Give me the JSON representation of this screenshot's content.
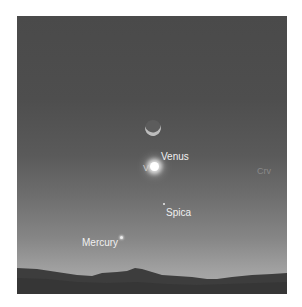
{
  "scene": {
    "colors": {
      "sky_top": "#4a4a4a",
      "sky_bottom": "#adadad",
      "horizon_silhouette": "#3a3a3a",
      "label": "#f0f0f0",
      "label_faint": "#8a8a8a"
    },
    "objects": [
      {
        "id": "moon",
        "kind": "crescent-moon",
        "label": ""
      },
      {
        "id": "venus",
        "kind": "planet",
        "label": "Venus",
        "secondary_label": "V"
      },
      {
        "id": "spica",
        "kind": "star",
        "label": "Spica"
      },
      {
        "id": "mercury",
        "kind": "planet",
        "label": "Mercury"
      },
      {
        "id": "crv",
        "kind": "constellation",
        "label": "Crv"
      }
    ]
  }
}
